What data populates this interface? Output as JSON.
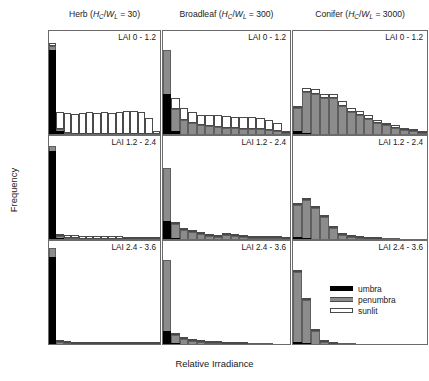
{
  "figure": {
    "xlabel": "Relative Irradiance",
    "ylabel": "Frequency"
  },
  "columns": [
    {
      "name": "Herb",
      "ratio": "30"
    },
    {
      "name": "Broadleaf",
      "ratio": "300"
    },
    {
      "name": "Conifer",
      "ratio": "3000"
    }
  ],
  "legend": {
    "items": [
      {
        "label": "umbra",
        "color": "#000000"
      },
      {
        "label": "penumbra",
        "color": "#8c8c8c"
      },
      {
        "label": "sunlit",
        "color": "#ffffff"
      }
    ]
  },
  "rows": [
    {
      "label": "LAI 0 - 1.2",
      "yticks": [
        "0.0",
        "0.1",
        "0.2",
        "0.3"
      ],
      "ymax": 0.3
    },
    {
      "label": "LAI 1.2 - 2.4",
      "yticks": [
        "0.0",
        "0.2",
        "0.4",
        "0.6"
      ],
      "ymax": 0.7
    },
    {
      "label": "LAI 2.4 - 3.6",
      "yticks": [
        "0.0",
        "0.3",
        "0.6"
      ],
      "ymax": 0.9
    }
  ],
  "xticks": [
    "0.0",
    "0.3",
    "0.6",
    "0.9",
    "1.2"
  ],
  "xlim": [
    0.0,
    1.35
  ],
  "chart_data": {
    "type": "bar",
    "title": "",
    "subtype": "stacked-histogram-grid",
    "xlabel": "Relative Irradiance",
    "ylabel": "Frequency",
    "grid": false,
    "legend_position": "inside-bottom-right",
    "series_names": [
      "umbra",
      "penumbra",
      "sunlit"
    ],
    "series_colors": [
      "#000000",
      "#8c8c8c",
      "#ffffff"
    ],
    "bin_width": 0.09,
    "bin_centers": [
      0.045,
      0.135,
      0.225,
      0.315,
      0.405,
      0.495,
      0.585,
      0.675,
      0.765,
      0.855,
      0.945,
      1.035,
      1.125,
      1.215,
      1.305
    ],
    "panels": [
      {
        "column": "Herb",
        "row": "LAI 0 - 1.2",
        "ylim": [
          0,
          0.3
        ],
        "umbra": [
          0.245,
          0.008,
          0,
          0,
          0,
          0,
          0,
          0,
          0,
          0,
          0,
          0,
          0,
          0,
          0
        ],
        "penumbra": [
          0.012,
          0.006,
          0.002,
          0.001,
          0.001,
          0.001,
          0.001,
          0.001,
          0.001,
          0.001,
          0.001,
          0.001,
          0.001,
          0.001,
          0.0
        ],
        "sunlit": [
          0.008,
          0.05,
          0.06,
          0.058,
          0.06,
          0.062,
          0.06,
          0.062,
          0.06,
          0.063,
          0.067,
          0.066,
          0.062,
          0.046,
          0.009
        ]
      },
      {
        "column": "Broadleaf",
        "row": "LAI 0 - 1.2",
        "ylim": [
          0,
          0.3
        ],
        "umbra": [
          0.118,
          0.01,
          0,
          0,
          0,
          0,
          0,
          0,
          0,
          0,
          0,
          0,
          0,
          0,
          0
        ],
        "penumbra": [
          0.126,
          0.064,
          0.04,
          0.032,
          0.026,
          0.022,
          0.02,
          0.018,
          0.017,
          0.016,
          0.015,
          0.014,
          0.012,
          0.01,
          0.004
        ],
        "sunlit": [
          0.0,
          0.03,
          0.037,
          0.033,
          0.03,
          0.033,
          0.035,
          0.034,
          0.032,
          0.034,
          0.034,
          0.033,
          0.03,
          0.022,
          0.006
        ]
      },
      {
        "column": "Conifer",
        "row": "LAI 0 - 1.2",
        "ylim": [
          0,
          0.3
        ],
        "umbra": [
          0.01,
          0.003,
          0,
          0,
          0,
          0,
          0,
          0,
          0,
          0,
          0,
          0,
          0,
          0,
          0
        ],
        "penumbra": [
          0.065,
          0.118,
          0.118,
          0.105,
          0.104,
          0.082,
          0.064,
          0.056,
          0.044,
          0.033,
          0.025,
          0.018,
          0.012,
          0.008,
          0.004
        ],
        "sunlit": [
          0.003,
          0.014,
          0.012,
          0.013,
          0.014,
          0.013,
          0.012,
          0.011,
          0.01,
          0.009,
          0.008,
          0.007,
          0.005,
          0.004,
          0.002
        ]
      },
      {
        "column": "Herb",
        "row": "LAI 1.2 - 2.4",
        "ylim": [
          0,
          0.7
        ],
        "umbra": [
          0.6,
          0.006,
          0,
          0,
          0,
          0,
          0,
          0,
          0,
          0,
          0,
          0,
          0,
          0,
          0
        ],
        "penumbra": [
          0.032,
          0.014,
          0.006,
          0.004,
          0.003,
          0.003,
          0.002,
          0.002,
          0.002,
          0.002,
          0.002,
          0.002,
          0.001,
          0.001,
          0.0
        ],
        "sunlit": [
          0.0,
          0.012,
          0.02,
          0.02,
          0.018,
          0.019,
          0.02,
          0.018,
          0.017,
          0.017,
          0.015,
          0.013,
          0.01,
          0.006,
          0.002
        ]
      },
      {
        "column": "Broadleaf",
        "row": "LAI 1.2 - 2.4",
        "ylim": [
          0,
          0.7
        ],
        "umbra": [
          0.12,
          0.004,
          0,
          0,
          0,
          0,
          0,
          0,
          0,
          0,
          0,
          0,
          0,
          0,
          0
        ],
        "penumbra": [
          0.36,
          0.1,
          0.06,
          0.046,
          0.034,
          0.022,
          0.014,
          0.024,
          0.022,
          0.014,
          0.01,
          0.008,
          0.006,
          0.004,
          0.002
        ],
        "sunlit": [
          0.0,
          0.004,
          0.004,
          0.004,
          0.004,
          0.004,
          0.003,
          0.003,
          0.003,
          0.003,
          0.002,
          0.002,
          0.002,
          0.001,
          0.001
        ]
      },
      {
        "column": "Conifer",
        "row": "LAI 1.2 - 2.4",
        "ylim": [
          0,
          0.7
        ],
        "umbra": [
          0.012,
          0.004,
          0,
          0,
          0,
          0,
          0,
          0,
          0,
          0,
          0,
          0,
          0,
          0,
          0
        ],
        "penumbra": [
          0.218,
          0.262,
          0.212,
          0.148,
          0.072,
          0.03,
          0.012,
          0.006,
          0.003,
          0.002,
          0.001,
          0.001,
          0.0,
          0.0,
          0.0
        ],
        "sunlit": [
          0.004,
          0.006,
          0.006,
          0.005,
          0.004,
          0.003,
          0.002,
          0.001,
          0.001,
          0.001,
          0.0,
          0.0,
          0.0,
          0.0,
          0.0
        ]
      },
      {
        "column": "Herb",
        "row": "LAI 2.4 - 3.6",
        "ylim": [
          0,
          0.9
        ],
        "umbra": [
          0.76,
          0.004,
          0,
          0,
          0,
          0,
          0,
          0,
          0,
          0,
          0,
          0,
          0,
          0,
          0
        ],
        "penumbra": [
          0.078,
          0.016,
          0.006,
          0.004,
          0.003,
          0.002,
          0.002,
          0.002,
          0.002,
          0.001,
          0.001,
          0.001,
          0.001,
          0.001,
          0.0
        ],
        "sunlit": [
          0.0,
          0.008,
          0.01,
          0.009,
          0.008,
          0.008,
          0.007,
          0.007,
          0.006,
          0.006,
          0.005,
          0.004,
          0.003,
          0.002,
          0.001
        ]
      },
      {
        "column": "Broadleaf",
        "row": "LAI 2.4 - 3.6",
        "ylim": [
          0,
          0.9
        ],
        "umbra": [
          0.11,
          0.006,
          0,
          0,
          0,
          0,
          0,
          0,
          0,
          0,
          0,
          0,
          0,
          0,
          0
        ],
        "penumbra": [
          0.62,
          0.076,
          0.046,
          0.026,
          0.014,
          0.008,
          0.005,
          0.004,
          0.003,
          0.002,
          0.001,
          0.001,
          0.001,
          0.0,
          0.0
        ],
        "sunlit": [
          0.0,
          0.004,
          0.003,
          0.002,
          0.002,
          0.002,
          0.001,
          0.001,
          0.001,
          0.001,
          0.0,
          0.0,
          0.0,
          0.0,
          0.0
        ]
      },
      {
        "column": "Conifer",
        "row": "LAI 2.4 - 3.6",
        "ylim": [
          0,
          0.9
        ],
        "umbra": [
          0.016,
          0.006,
          0,
          0,
          0,
          0,
          0,
          0,
          0,
          0,
          0,
          0,
          0,
          0,
          0
        ],
        "penumbra": [
          0.61,
          0.38,
          0.11,
          0.016,
          0.004,
          0.002,
          0.001,
          0.0,
          0.0,
          0.0,
          0.0,
          0.0,
          0.0,
          0.0,
          0.0
        ],
        "sunlit": [
          0.004,
          0.006,
          0.004,
          0.002,
          0.001,
          0.0,
          0.0,
          0.0,
          0.0,
          0.0,
          0.0,
          0.0,
          0.0,
          0.0,
          0.0
        ]
      }
    ]
  }
}
